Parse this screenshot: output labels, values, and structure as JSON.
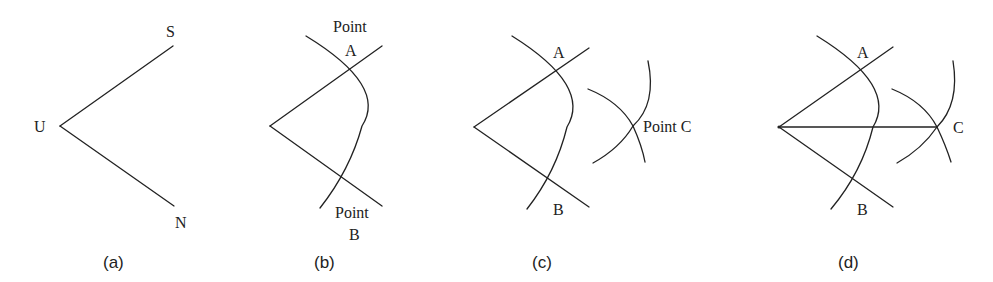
{
  "figure": {
    "panels": [
      {
        "caption": "(a)",
        "labels": {
          "vertex": "U",
          "upper_end": "S",
          "lower_end": "N"
        }
      },
      {
        "caption": "(b)",
        "labels": {
          "point_a_word": "Point",
          "point_a": "A",
          "point_b_word": "Point",
          "point_b": "B"
        }
      },
      {
        "caption": "(c)",
        "labels": {
          "point_a": "A",
          "point_b": "B",
          "point_c": "Point C"
        }
      },
      {
        "caption": "(d)",
        "labels": {
          "point_a": "A",
          "point_b": "B",
          "point_c": "C"
        }
      }
    ],
    "colors": {
      "stroke": "#222222",
      "background": "#ffffff"
    }
  }
}
